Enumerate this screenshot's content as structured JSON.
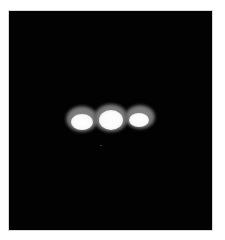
{
  "image": {
    "description": "Three bright glowing oval spots in a horizontal row on a black background",
    "background_color": "#020202",
    "border_color": "#ffffff",
    "spots": [
      {
        "name": "left",
        "cx": 82,
        "cy": 119,
        "halo_w": 32,
        "halo_h": 26,
        "core_w": 22,
        "core_h": 16,
        "core_dx": 0,
        "core_dy": 3
      },
      {
        "name": "center",
        "cx": 111,
        "cy": 118,
        "halo_w": 34,
        "halo_h": 28,
        "core_w": 24,
        "core_h": 20,
        "core_dx": 0,
        "core_dy": 2
      },
      {
        "name": "right",
        "cx": 140,
        "cy": 117,
        "halo_w": 30,
        "halo_h": 24,
        "core_w": 20,
        "core_h": 14,
        "core_dx": -1,
        "core_dy": 3
      }
    ],
    "artifact_dot": {
      "x": 100,
      "y": 145
    }
  }
}
